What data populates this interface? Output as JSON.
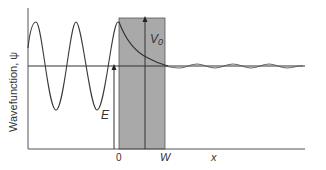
{
  "diagram": {
    "type": "quantum-tunneling",
    "y_axis_label": "Wavefunction, ψ",
    "x_axis_label": "x",
    "tick_labels": {
      "zero": "0",
      "width": "W"
    },
    "energy_label": "E",
    "barrier_label": "V0",
    "barrier_label_main": "V",
    "barrier_label_sub": "0",
    "colors": {
      "barrier_fill": "#a9a9a9",
      "line": "#333333",
      "wave": "#3a3a3a",
      "background": "#ffffff"
    }
  }
}
